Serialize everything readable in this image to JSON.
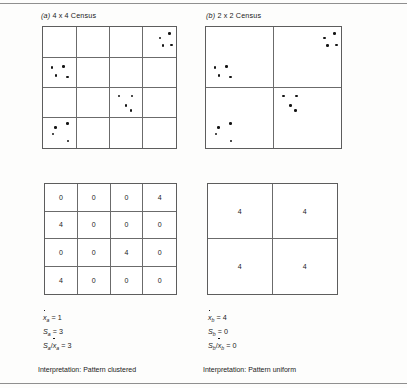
{
  "figure": {
    "panels": [
      {
        "id": "panel-a",
        "label_index": "(a)",
        "label_text": "4 x 4 Census",
        "grid": {
          "rows": 4,
          "cols": 4
        },
        "counts": [
          [
            0,
            0,
            0,
            4
          ],
          [
            4,
            0,
            0,
            0
          ],
          [
            0,
            0,
            4,
            0
          ],
          [
            4,
            0,
            0,
            0
          ]
        ],
        "stats": {
          "mean_symbol": "x",
          "mean_subscript": "a",
          "mean_value": "1",
          "variance_symbol": "S",
          "variance_subscript": "a",
          "variance_value": "3",
          "ratio_value": "3"
        },
        "interpretation_label": "Interpretation:",
        "interpretation_value": "Pattern clustered"
      },
      {
        "id": "panel-b",
        "label_index": "(b)",
        "label_text": "2 x 2 Census",
        "grid": {
          "rows": 2,
          "cols": 2
        },
        "counts": [
          [
            4,
            4
          ],
          [
            4,
            4
          ]
        ],
        "stats": {
          "mean_symbol": "x",
          "mean_subscript": "b",
          "mean_value": "4",
          "variance_symbol": "S",
          "variance_subscript": "b",
          "variance_value": "0",
          "ratio_value": "0"
        },
        "interpretation_label": "Interpretation:",
        "interpretation_value": "Pattern uniform"
      }
    ],
    "point_clusters": [
      {
        "cell_row": 1,
        "cell_col": 4,
        "count": 4,
        "points": [
          [
            0.5,
            0.32
          ],
          [
            0.8,
            0.18
          ],
          [
            0.6,
            0.58
          ],
          [
            0.86,
            0.55
          ]
        ]
      },
      {
        "cell_row": 2,
        "cell_col": 1,
        "count": 4,
        "points": [
          [
            0.24,
            0.3
          ],
          [
            0.58,
            0.28
          ],
          [
            0.36,
            0.58
          ],
          [
            0.7,
            0.62
          ]
        ]
      },
      {
        "cell_row": 3,
        "cell_col": 3,
        "count": 4,
        "points": [
          [
            0.26,
            0.26
          ],
          [
            0.66,
            0.26
          ],
          [
            0.48,
            0.58
          ],
          [
            0.62,
            0.74
          ]
        ]
      },
      {
        "cell_row": 4,
        "cell_col": 1,
        "count": 4,
        "points": [
          [
            0.34,
            0.3
          ],
          [
            0.7,
            0.18
          ],
          [
            0.26,
            0.52
          ],
          [
            0.72,
            0.76
          ]
        ]
      }
    ],
    "colors": {
      "ink": "#1a1a1a",
      "grid_line": "#6b6b6b",
      "frame": "#5d5d5d",
      "rule": "#8f8f8f",
      "dot": "#141414",
      "background": "#fdfdfc"
    }
  }
}
